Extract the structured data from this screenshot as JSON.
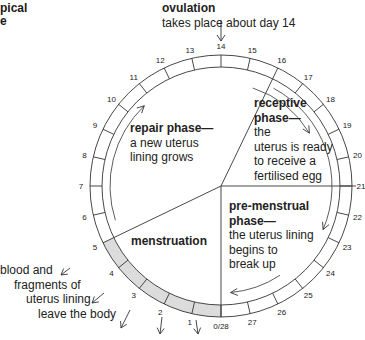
{
  "title_fragment": [
    "pical",
    "e"
  ],
  "ovulation": {
    "heading": "ovulation",
    "text": "takes place about day 14"
  },
  "phases": {
    "repair": {
      "heading": "repair phase—",
      "lines": [
        "a new uterus",
        "lining grows"
      ]
    },
    "receptive": {
      "heading_lines": [
        "receptive",
        "phase—"
      ],
      "lines": [
        "the",
        "uterus is ready",
        "to receive a",
        "fertilised egg"
      ]
    },
    "premenstrual": {
      "heading_lines": [
        "pre-menstrual",
        "phase—"
      ],
      "lines": [
        "the uterus lining",
        "begins to",
        "break up"
      ]
    },
    "menstruation": {
      "heading": "menstruation"
    }
  },
  "outflow_note": [
    "blood and",
    "fragments of",
    "uterus lining",
    "leave the body"
  ],
  "day_labels": [
    "0/28",
    "1",
    "2",
    "3",
    "4",
    "5",
    "6",
    "7",
    "8",
    "9",
    "10",
    "11",
    "12",
    "13",
    "14",
    "15",
    "16",
    "17",
    "18",
    "19",
    "20",
    "21",
    "22",
    "23",
    "24",
    "25",
    "26",
    "27"
  ],
  "cycle": {
    "days": 28,
    "ovulation_day": 14,
    "menstruation_days": [
      0,
      5
    ],
    "shade_color": "#dcdcdc",
    "line_color": "#333333"
  }
}
